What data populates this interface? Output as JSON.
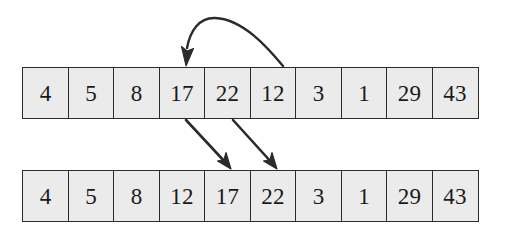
{
  "figure": {
    "background_color": "#ffffff",
    "cell_fill_color": "#ebebeb",
    "cell_border_color": "#2b2b2b",
    "ink_color": "#2b2b2b"
  },
  "arrays": [
    {
      "id": "array-before",
      "name": "array-before-insertion",
      "values": [
        "4",
        "5",
        "8",
        "17",
        "22",
        "12",
        "3",
        "1",
        "29",
        "43"
      ]
    },
    {
      "id": "array-after",
      "name": "array-after-insertion",
      "values": [
        "4",
        "5",
        "8",
        "12",
        "17",
        "22",
        "3",
        "1",
        "29",
        "43"
      ]
    }
  ],
  "arrows": [
    {
      "name": "insertion-curve-arrow",
      "from_value": "12",
      "to_value": "17",
      "description": "curved arrow from above cell 12 to above cell 17"
    },
    {
      "name": "shift-arrow-17",
      "from_value": "17",
      "to_value": "17",
      "description": "diagonal arrow showing 17 shifting one slot right"
    },
    {
      "name": "shift-arrow-22",
      "from_value": "22",
      "to_value": "22",
      "description": "diagonal arrow showing 22 shifting one slot right"
    }
  ],
  "scan_artifacts": {
    "line_1": "",
    "line_2": ""
  }
}
